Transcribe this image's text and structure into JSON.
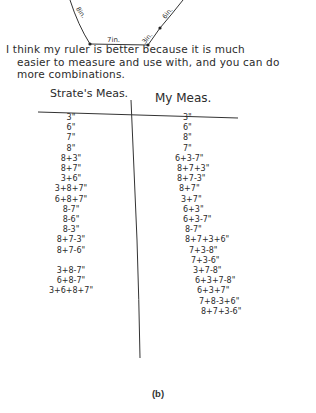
{
  "diagram": {
    "segment_labels": [
      "8in.",
      "7in.",
      "3in.",
      "6in."
    ]
  },
  "paragraph": {
    "line1": "I  think  my  ruler  is  better because it is much",
    "line2": "easier to measure and use with, and you can do",
    "line3": "more combinations."
  },
  "table": {
    "headers": [
      "Strate's Meas.",
      "My Meas."
    ],
    "left_column": [
      "3\"",
      "6\"",
      "7\"",
      "8\"",
      "8+3\"",
      "8+7\"",
      "3+6\"",
      "3+8+7\"",
      "6+8+7\"",
      "8-7\"",
      "8-6\"",
      "8-3\"",
      "8+7-3\"",
      "8+7-6\"",
      "",
      "3+8-7\"",
      "6+8-7\"",
      "3+6+8+7\""
    ],
    "right_column": [
      "3\"",
      "6\"",
      "8\"",
      "7\"",
      "6+3-7\"",
      "8+7+3\"",
      "8+7-3\"",
      "8+7\"",
      "3+7\"",
      "6+3\"",
      "6+3-7\"",
      "8-7\"",
      "8+7+3+6\"",
      "7+3-8\"",
      "7+3-6\"",
      "3+7-8\"",
      "6+3+7-8\"",
      "6+3+7\"",
      "7+8-3+6\"",
      "8+7+3-6\""
    ]
  },
  "caption": "(b)"
}
